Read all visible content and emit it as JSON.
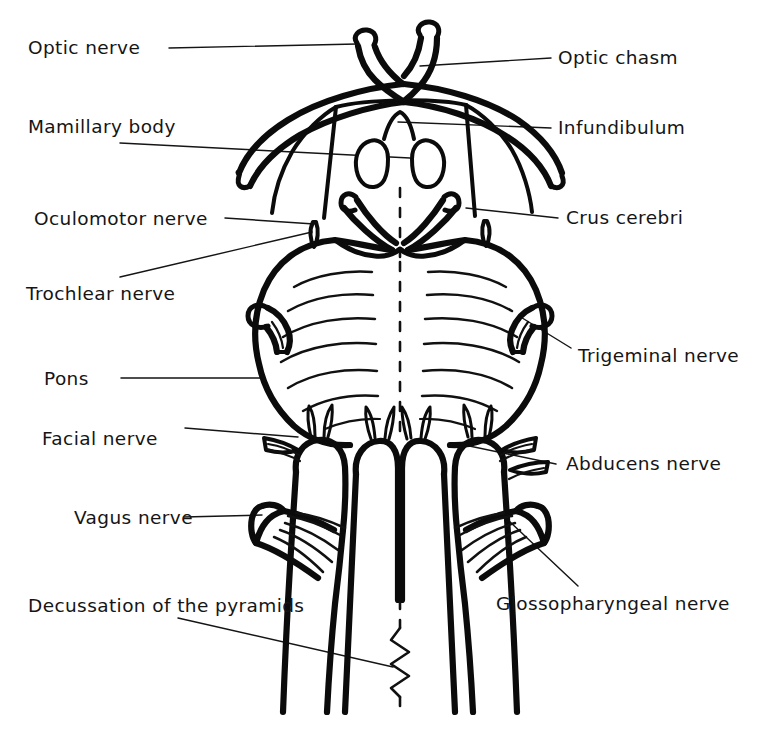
{
  "figure": {
    "ink_color": "#0b0b0b",
    "background_color": "#ffffff"
  },
  "labels": {
    "optic_nerve": "Optic nerve",
    "optic_chasm": "Optic chasm",
    "mamillary_body": "Mamillary body",
    "infundibulum": "Infundibulum",
    "oculomotor_nerve": "Oculomotor nerve",
    "crus_cerebri": "Crus cerebri",
    "trochlear_nerve": "Trochlear nerve",
    "trigeminal_nerve": "Trigeminal nerve",
    "pons": "Pons",
    "facial_nerve": "Facial nerve",
    "abducens_nerve": "Abducens nerve",
    "vagus_nerve": "Vagus nerve",
    "decussation_of_the_pyramids": "Decussation of the pyramids",
    "glossopharyngeal_nerve": "Glossopharyngeal nerve"
  },
  "label_list": [
    {
      "key": "optic_nerve",
      "text": "Optic nerve",
      "side": "left"
    },
    {
      "key": "optic_chasm",
      "text": "Optic chasm",
      "side": "right"
    },
    {
      "key": "mamillary_body",
      "text": "Mamillary body",
      "side": "left"
    },
    {
      "key": "infundibulum",
      "text": "Infundibulum",
      "side": "right"
    },
    {
      "key": "oculomotor_nerve",
      "text": "Oculomotor nerve",
      "side": "left"
    },
    {
      "key": "crus_cerebri",
      "text": "Crus cerebri",
      "side": "right"
    },
    {
      "key": "trochlear_nerve",
      "text": "Trochlear nerve",
      "side": "left"
    },
    {
      "key": "trigeminal_nerve",
      "text": "Trigeminal nerve",
      "side": "right"
    },
    {
      "key": "pons",
      "text": "Pons",
      "side": "left"
    },
    {
      "key": "facial_nerve",
      "text": "Facial nerve",
      "side": "left"
    },
    {
      "key": "abducens_nerve",
      "text": "Abducens nerve",
      "side": "right"
    },
    {
      "key": "vagus_nerve",
      "text": "Vagus nerve",
      "side": "left"
    },
    {
      "key": "decussation_of_the_pyramids",
      "text": "Decussation of the pyramids",
      "side": "left"
    },
    {
      "key": "glossopharyngeal_nerve",
      "text": "Glossopharyngeal nerve",
      "side": "right"
    }
  ]
}
